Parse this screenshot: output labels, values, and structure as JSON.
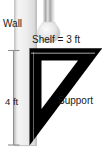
{
  "figure": {
    "background_color": "#ffffff"
  },
  "labels": {
    "wall": "Wall",
    "shelf": "Shelf = 3 ft",
    "height": "4 ft",
    "support": "Support"
  },
  "measurements": {
    "shelf_length": "3 ft",
    "wall_height": "4 ft"
  },
  "colors": {
    "bracket": "#000000",
    "wall_fill": "#e8e8e8",
    "wall_edge": "#b5b5b5",
    "dimension_line": "#8a8a8a",
    "text": "#1a1a1a",
    "fixture_light": "#f2f2f2",
    "fixture_mid": "#c9c9c9",
    "fixture_dark": "#9e9e9e"
  },
  "elements": {
    "wall_name": "wall",
    "shelf_name": "shelf-beam",
    "support_name": "diagonal-support",
    "fixture_name": "wall-fixture",
    "dimension_name": "height-dimension"
  }
}
